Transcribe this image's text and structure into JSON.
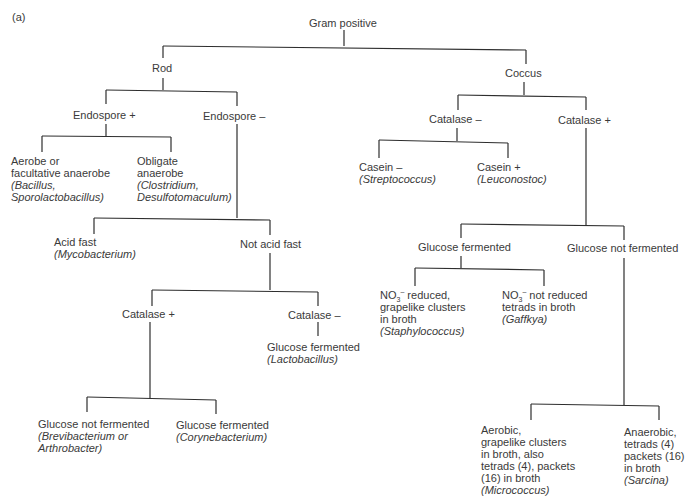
{
  "figure_label": "(a)",
  "nodes": {
    "root": {
      "label": "Gram positive"
    },
    "rod": {
      "label": "Rod"
    },
    "coccus": {
      "label": "Coccus"
    },
    "endo_pos": {
      "label": "Endospore  +"
    },
    "endo_neg": {
      "label": "Endospore  –"
    },
    "aerobe": {
      "lines": [
        "Aerobe or",
        "facultative anaerobe"
      ],
      "genus": [
        "(Bacillus,",
        "Sporolactobacillus)"
      ]
    },
    "obligate": {
      "lines": [
        "Obligate",
        "anaerobe"
      ],
      "genus": [
        "(Clostridium,",
        "Desulfotomaculum)"
      ]
    },
    "acid_fast": {
      "lines": [
        "Acid fast"
      ],
      "genus": [
        "(Mycobacterium)"
      ]
    },
    "not_acid_fast": {
      "label": "Not acid fast"
    },
    "rod_cat_pos": {
      "label": "Catalase  +"
    },
    "rod_cat_neg": {
      "label": "Catalase  –"
    },
    "lacto": {
      "lines": [
        "Glucose fermented"
      ],
      "genus": [
        "(Lactobacillus)"
      ]
    },
    "brevi": {
      "lines": [
        "Glucose not fermented"
      ],
      "genus": [
        "(Brevibacterium or",
        "Arthrobacter)"
      ]
    },
    "coryne": {
      "lines": [
        "Glucose fermented"
      ],
      "genus": [
        "(Corynebacterium)"
      ]
    },
    "cocc_cat_neg": {
      "label": "Catalase  –"
    },
    "cocc_cat_pos": {
      "label": "Catalase  +"
    },
    "casein_neg": {
      "lines": [
        "Casein  –"
      ],
      "genus": [
        "(Streptococcus)"
      ]
    },
    "casein_pos": {
      "lines": [
        "Casein  +"
      ],
      "genus": [
        "(Leuconostoc)"
      ]
    },
    "gluc_ferm": {
      "label": "Glucose fermented"
    },
    "gluc_not_ferm": {
      "label": "Glucose not fermented"
    },
    "staph": {
      "no3": "NO",
      "sub": "3",
      "sup": "–",
      "first_rest": " reduced,",
      "lines": [
        "grapelike clusters",
        "in broth"
      ],
      "genus": [
        "(Staphylococcus)"
      ]
    },
    "gaffkya": {
      "no3": "NO",
      "sub": "3",
      "sup": "–",
      "first_rest": " not reduced",
      "lines": [
        "tetrads in broth"
      ],
      "genus": [
        "(Gaffkya)"
      ]
    },
    "micro": {
      "lines": [
        "Aerobic,",
        "grapelike clusters",
        "in broth, also",
        "tetrads (4), packets",
        "(16) in broth"
      ],
      "genus": [
        "(Micrococcus)"
      ]
    },
    "sarcina": {
      "lines": [
        "Anaerobic,",
        "tetrads (4)",
        "packets (16)",
        "in broth"
      ],
      "genus": [
        "(Sarcina)"
      ]
    }
  },
  "colors": {
    "line": "#2e2e2e",
    "text": "#3a3a3a",
    "background": "#ffffff"
  }
}
